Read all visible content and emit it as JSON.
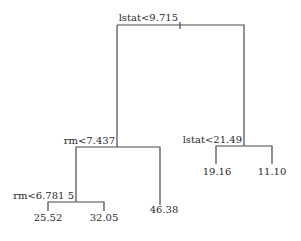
{
  "tree": {
    "root": {
      "split": "lstat<9.715",
      "left": {
        "split": "rm<7.437",
        "left": {
          "split": "rm<6.781 5",
          "left": {
            "value": "25.52"
          },
          "right": {
            "value": "32.05"
          }
        },
        "right": {
          "value": "46.38"
        }
      },
      "right": {
        "split": "lstat<21.49",
        "left": {
          "value": "19.16"
        },
        "right": {
          "value": "11.10"
        }
      }
    }
  },
  "colors": {
    "line": "#4a4a4a",
    "text": "#2a2a2a",
    "background": "#ffffff"
  }
}
